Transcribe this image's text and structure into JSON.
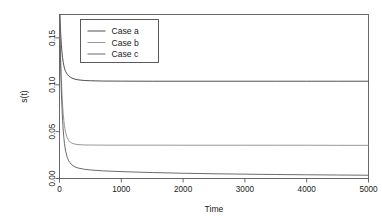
{
  "chart_data": {
    "type": "line",
    "title": "",
    "xlabel": "Time",
    "ylabel": "s(t)",
    "xlim": [
      0,
      5000
    ],
    "ylim": [
      0.0,
      0.175
    ],
    "grid": false,
    "legend_position": "top-left",
    "x_ticks": [
      {
        "value": 0,
        "label": "0"
      },
      {
        "value": 1000,
        "label": "1000"
      },
      {
        "value": 2000,
        "label": "2000"
      },
      {
        "value": 3000,
        "label": "3000"
      },
      {
        "value": 4000,
        "label": "4000"
      },
      {
        "value": 5000,
        "label": "5000"
      }
    ],
    "y_ticks": [
      {
        "value": 0.0,
        "label": "0.00"
      },
      {
        "value": 0.05,
        "label": "0.05"
      },
      {
        "value": 0.1,
        "label": "0.10"
      },
      {
        "value": 0.15,
        "label": "0.15"
      }
    ],
    "series": [
      {
        "name": "Case a",
        "color": "#3c3c3c",
        "asymptote": 0.105,
        "x": [
          0,
          10,
          20,
          30,
          40,
          50,
          60,
          70,
          80,
          90,
          100,
          125,
          150,
          175,
          200,
          250,
          300,
          400,
          500,
          700,
          1000,
          1500,
          2000,
          2500,
          3000,
          3500,
          4000,
          4500,
          5000
        ],
        "values": [
          0.185,
          0.168,
          0.154,
          0.143,
          0.135,
          0.129,
          0.124,
          0.1205,
          0.1178,
          0.1157,
          0.114,
          0.1112,
          0.1094,
          0.1081,
          0.1072,
          0.106,
          0.1053,
          0.1046,
          0.1043,
          0.104,
          0.1039,
          0.1038,
          0.1038,
          0.1038,
          0.1038,
          0.1038,
          0.1038,
          0.1038,
          0.1038
        ]
      },
      {
        "name": "Case b",
        "color": "#8c8c8c",
        "asymptote": 0.036,
        "x": [
          0,
          10,
          20,
          30,
          40,
          50,
          60,
          70,
          80,
          90,
          100,
          125,
          150,
          175,
          200,
          250,
          300,
          400,
          500,
          700,
          1000,
          1500,
          2000,
          2500,
          3000,
          3500,
          4000,
          4500,
          5000
        ],
        "values": [
          0.185,
          0.152,
          0.126,
          0.106,
          0.0905,
          0.0785,
          0.0692,
          0.062,
          0.0564,
          0.0521,
          0.0487,
          0.0434,
          0.0405,
          0.0388,
          0.0378,
          0.0367,
          0.0362,
          0.0358,
          0.0357,
          0.0356,
          0.0356,
          0.0356,
          0.0355,
          0.0355,
          0.0355,
          0.0355,
          0.0355,
          0.0354,
          0.0354
        ]
      },
      {
        "name": "Case c",
        "color": "#5a5a5a",
        "asymptote": 0.003,
        "x": [
          0,
          10,
          20,
          30,
          40,
          50,
          60,
          70,
          80,
          90,
          100,
          125,
          150,
          200,
          250,
          300,
          400,
          500,
          700,
          900,
          1200,
          1500,
          2000,
          2500,
          3000,
          3500,
          4000,
          4500,
          5000
        ],
        "values": [
          0.185,
          0.146,
          0.116,
          0.0932,
          0.0757,
          0.0622,
          0.0518,
          0.0438,
          0.0376,
          0.0328,
          0.0291,
          0.0226,
          0.0187,
          0.0145,
          0.0124,
          0.0112,
          0.00985,
          0.00913,
          0.0082,
          0.0076,
          0.0069,
          0.00635,
          0.0056,
          0.00505,
          0.00462,
          0.00427,
          0.00398,
          0.00372,
          0.0035
        ]
      }
    ]
  },
  "legend": {
    "entries": [
      "Case a",
      "Case b",
      "Case c"
    ]
  }
}
